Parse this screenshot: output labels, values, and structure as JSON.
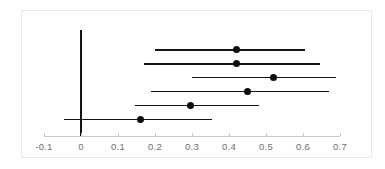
{
  "chart_data": {
    "type": "scatter",
    "subtype": "forest-plot",
    "title": "",
    "xlabel": "",
    "ylabel": "",
    "xlim": [
      -0.13,
      0.73
    ],
    "xticks": [
      -0.1,
      0,
      0.1,
      0.2,
      0.3,
      0.4,
      0.5,
      0.6,
      0.7
    ],
    "xticklabels": [
      "-0.1",
      "0",
      "0.1",
      "0.2",
      "0.3",
      "0.4",
      "0.5",
      "0.6",
      "0.7"
    ],
    "grid": false,
    "legend": null,
    "reference_line": {
      "value": 0,
      "orientation": "vertical",
      "color": "#141414"
    },
    "marker_color": "#0d0d0d",
    "line_color": "#141414",
    "axis_color": "#c9c9c9",
    "tick_label_color": "#6e6e6e",
    "frame_color": "#e8e8e8",
    "rows": [
      {
        "label": "",
        "estimate": 0.42,
        "ci_low": 0.2,
        "ci_high": 0.605
      },
      {
        "label": "",
        "estimate": 0.42,
        "ci_low": 0.17,
        "ci_high": 0.645
      },
      {
        "label": "",
        "estimate": 0.52,
        "ci_low": 0.3,
        "ci_high": 0.69
      },
      {
        "label": "",
        "estimate": 0.45,
        "ci_low": 0.19,
        "ci_high": 0.67
      },
      {
        "label": "",
        "estimate": 0.295,
        "ci_low": 0.145,
        "ci_high": 0.48
      },
      {
        "label": "",
        "estimate": 0.16,
        "ci_low": -0.045,
        "ci_high": 0.355
      }
    ]
  }
}
